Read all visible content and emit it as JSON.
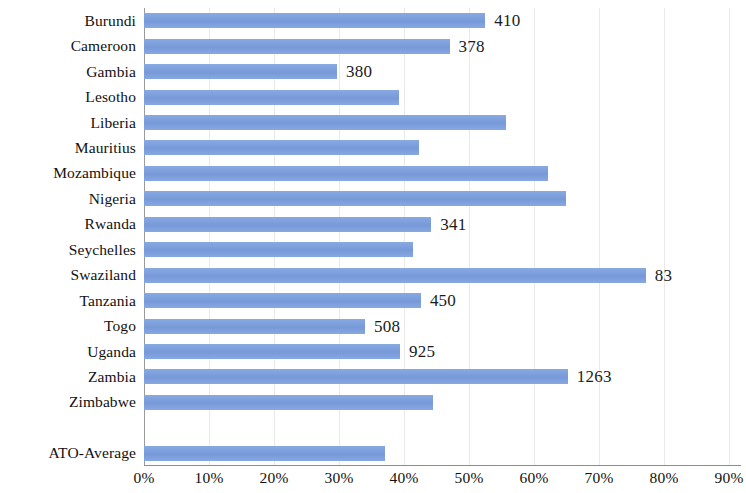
{
  "chart_data": {
    "type": "bar",
    "orientation": "horizontal",
    "title": "",
    "subtitle": "",
    "xlabel": "",
    "ylabel": "",
    "xlim": [
      0,
      90
    ],
    "grid": true,
    "legend": null,
    "bar_color": "#7b9fdc",
    "categories": [
      "Burundi",
      "Cameroon",
      "Gambia",
      "Lesotho",
      "Liberia",
      "Mauritius",
      "Mozambique",
      "Nigeria",
      "Rwanda",
      "Seychelles",
      "Swaziland",
      "Tanzania",
      "Togo",
      "Uganda",
      "Zambia",
      "Zimbabwe",
      "",
      "ATO-Average"
    ],
    "values": [
      52.5,
      47.0,
      29.7,
      39.2,
      55.7,
      42.3,
      62.2,
      64.9,
      44.2,
      41.4,
      77.2,
      42.6,
      34.0,
      39.4,
      65.2,
      44.5,
      null,
      37.0
    ],
    "point_labels": [
      "410",
      "378",
      "380",
      "",
      "",
      "",
      "",
      "",
      "341",
      "",
      "83",
      "450",
      "508",
      "925",
      "1263",
      "",
      "",
      ""
    ],
    "xticks": [
      "0%",
      "10%",
      "20%",
      "30%",
      "40%",
      "50%",
      "60%",
      "70%",
      "80%",
      "90%"
    ],
    "xtick_values": [
      0,
      10,
      20,
      30,
      40,
      50,
      60,
      70,
      80,
      90
    ]
  }
}
